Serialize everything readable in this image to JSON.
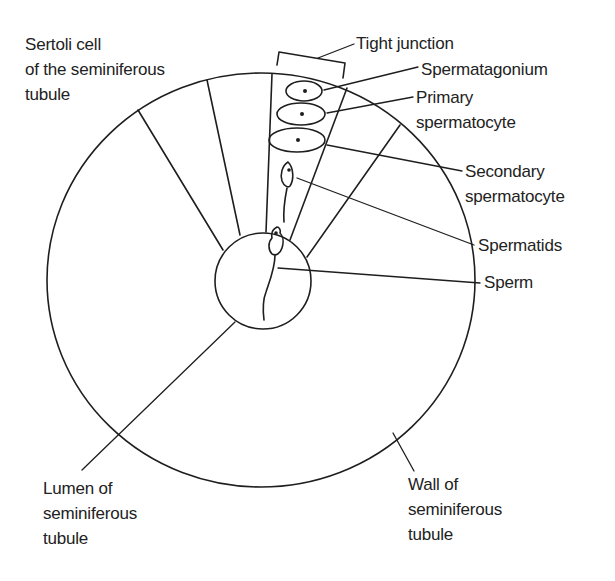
{
  "diagram": {
    "colors": {
      "line": "#1e1e1e",
      "text": "#222222",
      "background": "#ffffff"
    },
    "labels": {
      "sertoli": [
        "Sertoli cell",
        "of the seminiferous",
        "tubule"
      ],
      "tight_junction": "Tight junction",
      "spermatagonium": "Spermatagonium",
      "primary": [
        "Primary",
        "spermatocyte"
      ],
      "secondary": [
        "Secondary",
        "spermatocyte"
      ],
      "spermatids": "Spermatids",
      "sperm": "Sperm",
      "lumen": [
        "Lumen of",
        "seminiferous",
        "tubule"
      ],
      "wall": [
        "Wall of",
        "seminiferous",
        "tubule"
      ]
    }
  }
}
